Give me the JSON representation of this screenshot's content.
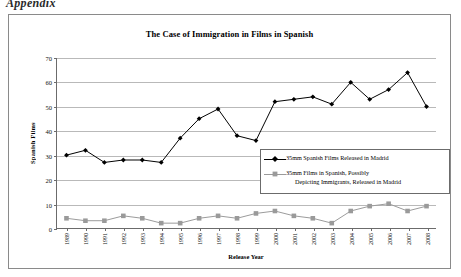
{
  "appendix_heading": "Appendix",
  "chart_data": {
    "type": "line",
    "title": "The Case of Immigration in Films in Spanish",
    "xlabel": "Release Year",
    "ylabel": "Spanish Films",
    "ylim": [
      0,
      70
    ],
    "ytick_step": 10,
    "yticks": [
      0,
      10,
      20,
      30,
      40,
      50,
      60,
      70
    ],
    "grid": true,
    "legend_position": "inside-right",
    "categories": [
      "1989",
      "1990",
      "1991",
      "1992",
      "1993",
      "1994",
      "1995",
      "1996",
      "1997",
      "1998",
      "1999",
      "2000",
      "2001",
      "2002",
      "2003",
      "2004",
      "2005",
      "2006",
      "2007",
      "2008"
    ],
    "series": [
      {
        "name": "35mm Spanish Films Released in Madrid",
        "marker": "diamond",
        "color": "#000000",
        "values": [
          30,
          32,
          27,
          28,
          28,
          27,
          37,
          45,
          49,
          38,
          36,
          52,
          53,
          54,
          51,
          60,
          53,
          57,
          64,
          50
        ]
      },
      {
        "name": "35mm Films in Spanish, Possibly Depicting Immigrants, Released in Madrid",
        "marker": "square",
        "color": "#9a9a9a",
        "values": [
          4,
          3,
          3,
          5,
          4,
          2,
          2,
          4,
          5,
          4,
          6,
          7,
          5,
          4,
          2,
          7,
          9,
          10,
          7,
          9
        ]
      }
    ]
  },
  "legend": {
    "entries": [
      {
        "line1": "35mm Spanish Films Released in Madrid",
        "line2": ""
      },
      {
        "line1": "35mm Films in Spanish, Possibly",
        "line2": "Depicting Immigrants, Released in Madrid"
      }
    ]
  }
}
